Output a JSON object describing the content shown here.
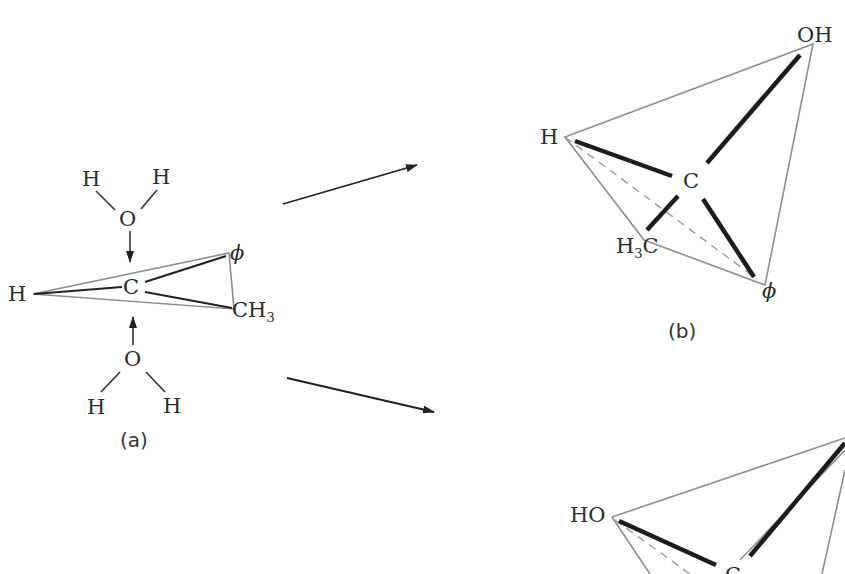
{
  "figure": {
    "panel_a": {
      "caption": "(a)",
      "central_atom": "C",
      "substituents": {
        "left": "H",
        "top_right": "ϕ",
        "bottom_right": "CH",
        "bottom_right_sub": "3"
      },
      "water_top": {
        "O": "O",
        "H1": "H",
        "H2": "H"
      },
      "water_bottom": {
        "O": "O",
        "H1": "H",
        "H2": "H"
      }
    },
    "panel_b": {
      "caption": "(b)",
      "central_atom": "C",
      "substituents": {
        "top_right": "OH",
        "left": "H",
        "bottom_left": "H",
        "bottom_left_sub": "3",
        "bottom_left_suffix": "C",
        "bottom_right": "ϕ"
      }
    },
    "panel_c": {
      "central_atom": "C",
      "substituents": {
        "left": "HO"
      }
    },
    "arrows": [
      {
        "from": [
          283,
          204
        ],
        "to": [
          417,
          165
        ]
      },
      {
        "from": [
          287,
          378
        ],
        "to": [
          434,
          412
        ]
      }
    ]
  }
}
